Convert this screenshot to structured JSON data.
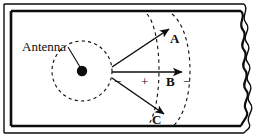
{
  "figure": {
    "background_color": "#ffffff",
    "line_color": "#0d0d0d",
    "width": 268,
    "height": 137
  },
  "labels": {
    "antenna": "Antenna",
    "ray_a": "A",
    "ray_b": "B",
    "ray_c": "C",
    "sign_minus_left": "−",
    "sign_plus_center": "+",
    "sign_minus_right": "−"
  },
  "elements": {
    "waveguide_wall_top": "waveguide-top-wall",
    "waveguide_wall_bottom": "waveguide-bottom-wall",
    "waveguide_wall_left": "waveguide-left-wall",
    "break_edge_right": "waveguide-break-edge",
    "antenna_point": "antenna-source-dot",
    "near_field_circle": "antenna-near-field-circle",
    "wavefront_inner": "wavefront-arc-inner",
    "wavefront_outer": "wavefront-arc-outer",
    "ray_arrow_a": "ray-arrow-a",
    "ray_arrow_b": "ray-arrow-b",
    "ray_arrow_c": "ray-arrow-c",
    "antenna_leader": "antenna-leader-line"
  }
}
